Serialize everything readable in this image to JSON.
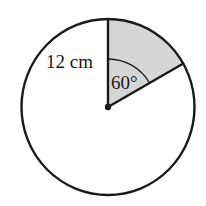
{
  "diagram": {
    "type": "circle-sector",
    "radius_label": "12 cm",
    "angle_label": "60°",
    "sector_angle_deg": 60,
    "colors": {
      "stroke": "#1a1a1a",
      "sector_fill": "#d6d6d6",
      "background": "#ffffff"
    }
  }
}
